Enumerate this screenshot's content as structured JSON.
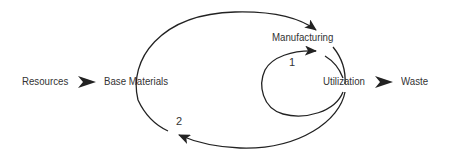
{
  "diagram": {
    "type": "material-flow-cycle",
    "nodes": [
      {
        "id": "resources",
        "label": "Resources"
      },
      {
        "id": "base_materials",
        "label": "Base Materials"
      },
      {
        "id": "manufacturing",
        "label": "Manufacturing"
      },
      {
        "id": "utilization",
        "label": "Utilization"
      },
      {
        "id": "waste",
        "label": "Waste"
      }
    ],
    "edges": [
      {
        "from": "resources",
        "to": "base_materials",
        "style": "arrowhead"
      },
      {
        "from": "base_materials",
        "to": "manufacturing",
        "style": "curved-arrow"
      },
      {
        "from": "manufacturing",
        "to": "utilization",
        "style": "curve"
      },
      {
        "from": "utilization",
        "to": "waste",
        "style": "arrowhead"
      },
      {
        "from": "utilization",
        "to": "manufacturing",
        "style": "curved-arrow",
        "label": "1"
      },
      {
        "from": "utilization",
        "to": "base_materials",
        "style": "curved-arrow",
        "label": "2"
      }
    ],
    "loop_labels": {
      "inner": "1",
      "outer": "2"
    },
    "colors": {
      "line": "#222222",
      "text": "#333333",
      "background": "#ffffff"
    }
  }
}
